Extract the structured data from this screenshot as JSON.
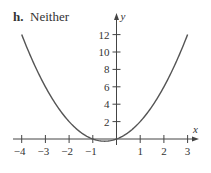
{
  "panel": {
    "letter": "h.",
    "title": "Neither"
  },
  "chart_data": {
    "type": "line",
    "title": "h. Neither",
    "function": "y = x^2 + x",
    "xlabel": "x",
    "ylabel": "y",
    "xlim": [
      -4,
      3
    ],
    "ylim": [
      0,
      12
    ],
    "x_ticks": [
      -4,
      -3,
      -2,
      -1,
      1,
      2,
      3
    ],
    "x_tick_labels": [
      "−4",
      "−3",
      "−2",
      "−1",
      "1",
      "2",
      "3"
    ],
    "y_ticks": [
      2,
      4,
      6,
      8,
      10,
      12
    ],
    "y_tick_labels": [
      "2",
      "4",
      "6",
      "8",
      "10",
      "12"
    ],
    "grid": false,
    "legend": null,
    "series": [
      {
        "name": "y = x^2 + x",
        "x": [
          -4,
          -3.5,
          -3,
          -2.5,
          -2,
          -1.5,
          -1,
          -0.5,
          0,
          0.5,
          1,
          1.5,
          2,
          2.5,
          3
        ],
        "y": [
          12,
          8.75,
          6,
          3.75,
          2,
          0.75,
          0,
          -0.25,
          0,
          0.75,
          2,
          3.75,
          6,
          8.75,
          12
        ]
      }
    ],
    "colors": {
      "curve": "#555555",
      "axes": "#444444",
      "text": "#333333"
    }
  }
}
